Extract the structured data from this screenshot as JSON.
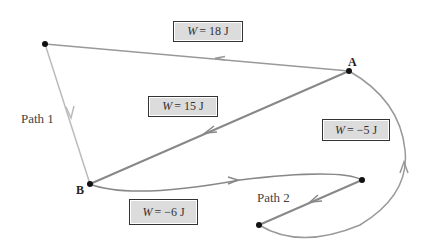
{
  "diagram": {
    "points": [
      {
        "id": "A",
        "label": "A"
      },
      {
        "id": "B",
        "label": "B"
      }
    ],
    "paths": [
      {
        "id": "path1",
        "label": "Path 1"
      },
      {
        "id": "path2",
        "label": "Path 2"
      }
    ],
    "work_labels": [
      {
        "id": "w18",
        "symbol": "W",
        "text": "= 18 J"
      },
      {
        "id": "w15",
        "symbol": "W",
        "text": "= 15 J"
      },
      {
        "id": "wm5",
        "symbol": "W",
        "text": "= −5 J"
      },
      {
        "id": "wm6",
        "symbol": "W",
        "text": "= −6 J"
      }
    ],
    "colors": {
      "line": "#888888",
      "light_line": "#bbbbbb",
      "box_fill": "#dcdcdc",
      "point": "#111111"
    }
  }
}
